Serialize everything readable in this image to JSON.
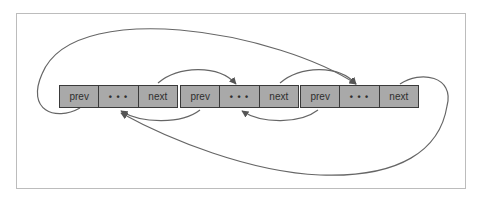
{
  "diagram": {
    "title": "",
    "type": "circular doubly linked list",
    "colors": {
      "node_fill": "#a9a9a9",
      "node_border": "#3a3a3a",
      "arrow": "#555555",
      "frame": "#bcbcbc"
    },
    "nodes": [
      {
        "id": "n1",
        "cells": [
          "prev",
          "• • •",
          "next"
        ]
      },
      {
        "id": "n2",
        "cells": [
          "prev",
          "• • •",
          "next"
        ]
      },
      {
        "id": "n3",
        "cells": [
          "prev",
          "• • •",
          "next"
        ]
      }
    ],
    "links": [
      {
        "from": "n1.next",
        "to": "n2"
      },
      {
        "from": "n2.next",
        "to": "n3"
      },
      {
        "from": "n3.next",
        "to": "n1"
      },
      {
        "from": "n2.prev",
        "to": "n1"
      },
      {
        "from": "n3.prev",
        "to": "n2"
      },
      {
        "from": "n1.prev",
        "to": "n3"
      }
    ]
  }
}
